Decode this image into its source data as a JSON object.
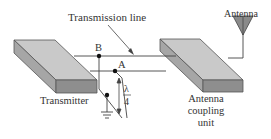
{
  "labels": {
    "transmission_line": "Transmission line",
    "antenna": "Antenna",
    "transmitter": "Transmitter",
    "coupling_unit_line1": "Antenna",
    "coupling_unit_line2": "coupling",
    "coupling_unit_line3": "unit",
    "point_a": "A",
    "point_b": "B",
    "lambda": "λ",
    "four": "4"
  },
  "colors": {
    "box_top": "#c8c8c8",
    "box_front": "#8f8f8f",
    "box_side": "#a8a8a8",
    "line": "#444444",
    "antenna_fill": "#8a8a8a"
  }
}
